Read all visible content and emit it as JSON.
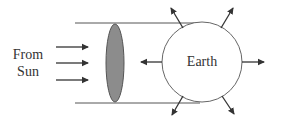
{
  "diagram": {
    "source_label_line1": "From",
    "source_label_line2": "Sun",
    "body_label": "Earth",
    "elements": {
      "incoming_arrows": 3,
      "shadow_disk": "cross-section disk (shaded ellipse)",
      "outgoing_arrows": 6
    },
    "colors": {
      "line": "#333333",
      "disk_fill": "#8c8c8c",
      "background": "#ffffff"
    }
  }
}
